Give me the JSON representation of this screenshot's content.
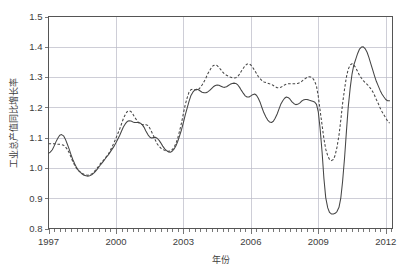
{
  "chart_data": {
    "type": "line",
    "title": "",
    "xlabel": "年份",
    "ylabel": "工业总产值同比增长率",
    "xlim": [
      1997.0,
      2012.3
    ],
    "ylim": [
      0.8,
      1.5
    ],
    "grid": true,
    "legend": "none",
    "xticks": [
      "1997",
      "2000",
      "2003",
      "2006",
      "2009",
      "2012"
    ],
    "xtick_values": [
      1997,
      2000,
      2003,
      2006,
      2009,
      2012
    ],
    "yticks": [
      "0.8",
      "0.9",
      "1.0",
      "1.1",
      "1.2",
      "1.3",
      "1.4",
      "1.5"
    ],
    "ytick_values": [
      0.8,
      0.9,
      1.0,
      1.1,
      1.2,
      1.3,
      1.4,
      1.5
    ],
    "x_minor_tick_interval": 0.25,
    "line_color": "#454545",
    "grid_color": "#b9b9c6",
    "axis_color": "#555555",
    "series": [
      {
        "name": "实际序列",
        "style": "solid",
        "x": [
          1997.0,
          1997.08,
          1997.17,
          1997.25,
          1997.33,
          1997.42,
          1997.5,
          1997.58,
          1997.67,
          1997.75,
          1997.83,
          1997.92,
          1998.0,
          1998.08,
          1998.17,
          1998.25,
          1998.33,
          1998.42,
          1998.5,
          1998.58,
          1998.67,
          1998.75,
          1998.83,
          1998.92,
          1999.0,
          1999.08,
          1999.17,
          1999.25,
          1999.33,
          1999.42,
          1999.5,
          1999.58,
          1999.67,
          1999.75,
          1999.83,
          1999.92,
          2000.0,
          2000.08,
          2000.17,
          2000.25,
          2000.33,
          2000.42,
          2000.5,
          2000.58,
          2000.67,
          2000.75,
          2000.83,
          2000.92,
          2001.0,
          2001.08,
          2001.17,
          2001.25,
          2001.33,
          2001.42,
          2001.5,
          2001.58,
          2001.67,
          2001.75,
          2001.83,
          2001.92,
          2002.0,
          2002.08,
          2002.17,
          2002.25,
          2002.33,
          2002.42,
          2002.5,
          2002.58,
          2002.67,
          2002.75,
          2002.83,
          2002.92,
          2003.0,
          2003.08,
          2003.17,
          2003.25,
          2003.33,
          2003.42,
          2003.5,
          2003.58,
          2003.67,
          2003.75,
          2003.83,
          2003.92,
          2004.0,
          2004.08,
          2004.17,
          2004.25,
          2004.33,
          2004.42,
          2004.5,
          2004.58,
          2004.67,
          2004.75,
          2004.83,
          2004.92,
          2005.0,
          2005.08,
          2005.17,
          2005.25,
          2005.33,
          2005.42,
          2005.5,
          2005.58,
          2005.67,
          2005.75,
          2005.83,
          2005.92,
          2006.0,
          2006.08,
          2006.17,
          2006.25,
          2006.33,
          2006.42,
          2006.5,
          2006.58,
          2006.67,
          2006.75,
          2006.83,
          2006.92,
          2007.0,
          2007.08,
          2007.17,
          2007.25,
          2007.33,
          2007.42,
          2007.5,
          2007.58,
          2007.67,
          2007.75,
          2007.83,
          2007.92,
          2008.0,
          2008.08,
          2008.17,
          2008.25,
          2008.33,
          2008.42,
          2008.5,
          2008.58,
          2008.67,
          2008.75,
          2008.83,
          2008.92,
          2009.0,
          2009.08,
          2009.17,
          2009.25,
          2009.33,
          2009.42,
          2009.5,
          2009.58,
          2009.67,
          2009.75,
          2009.83,
          2009.92,
          2010.0,
          2010.08,
          2010.17,
          2010.25,
          2010.33,
          2010.42,
          2010.5,
          2010.58,
          2010.67,
          2010.75,
          2010.83,
          2010.92,
          2011.0,
          2011.08,
          2011.17,
          2011.25,
          2011.33,
          2011.42,
          2011.5,
          2011.58,
          2011.67,
          2011.75,
          2011.83,
          2011.92,
          2012.0,
          2012.08,
          2012.17
        ],
        "values": [
          1.048,
          1.052,
          1.06,
          1.072,
          1.086,
          1.099,
          1.108,
          1.11,
          1.106,
          1.095,
          1.08,
          1.062,
          1.044,
          1.028,
          1.013,
          1.001,
          0.992,
          0.985,
          0.98,
          0.976,
          0.974,
          0.973,
          0.974,
          0.977,
          0.982,
          0.988,
          0.996,
          1.004,
          1.012,
          1.02,
          1.028,
          1.036,
          1.044,
          1.053,
          1.062,
          1.072,
          1.083,
          1.095,
          1.108,
          1.122,
          1.135,
          1.146,
          1.153,
          1.156,
          1.155,
          1.152,
          1.15,
          1.15,
          1.15,
          1.148,
          1.143,
          1.134,
          1.122,
          1.11,
          1.102,
          1.099,
          1.1,
          1.101,
          1.098,
          1.091,
          1.082,
          1.072,
          1.063,
          1.057,
          1.053,
          1.052,
          1.055,
          1.062,
          1.073,
          1.088,
          1.106,
          1.127,
          1.15,
          1.174,
          1.198,
          1.22,
          1.238,
          1.25,
          1.257,
          1.26,
          1.258,
          1.254,
          1.25,
          1.248,
          1.248,
          1.251,
          1.256,
          1.262,
          1.268,
          1.272,
          1.274,
          1.273,
          1.27,
          1.267,
          1.266,
          1.268,
          1.272,
          1.276,
          1.279,
          1.28,
          1.279,
          1.274,
          1.266,
          1.256,
          1.246,
          1.238,
          1.234,
          1.234,
          1.238,
          1.242,
          1.244,
          1.24,
          1.23,
          1.215,
          1.198,
          1.182,
          1.168,
          1.158,
          1.152,
          1.15,
          1.154,
          1.164,
          1.178,
          1.194,
          1.21,
          1.222,
          1.23,
          1.234,
          1.232,
          1.226,
          1.218,
          1.212,
          1.209,
          1.21,
          1.214,
          1.22,
          1.224,
          1.226,
          1.226,
          1.224,
          1.222,
          1.22,
          1.218,
          1.21,
          1.185,
          1.13,
          1.05,
          0.965,
          0.902,
          0.868,
          0.853,
          0.848,
          0.848,
          0.85,
          0.856,
          0.87,
          0.9,
          0.955,
          1.035,
          1.12,
          1.2,
          1.265,
          1.31,
          1.34,
          1.36,
          1.378,
          1.392,
          1.399,
          1.4,
          1.394,
          1.382,
          1.365,
          1.345,
          1.324,
          1.304,
          1.286,
          1.27,
          1.256,
          1.244,
          1.234,
          1.226,
          1.222,
          1.222
        ]
      },
      {
        "name": "拟合序列",
        "style": "dashed",
        "x": [
          1997.0,
          1997.08,
          1997.17,
          1997.25,
          1997.33,
          1997.42,
          1997.5,
          1997.58,
          1997.67,
          1997.75,
          1997.83,
          1997.92,
          1998.0,
          1998.08,
          1998.17,
          1998.25,
          1998.33,
          1998.42,
          1998.5,
          1998.58,
          1998.67,
          1998.75,
          1998.83,
          1998.92,
          1999.0,
          1999.08,
          1999.17,
          1999.25,
          1999.33,
          1999.42,
          1999.5,
          1999.58,
          1999.67,
          1999.75,
          1999.83,
          1999.92,
          2000.0,
          2000.08,
          2000.17,
          2000.25,
          2000.33,
          2000.42,
          2000.5,
          2000.58,
          2000.67,
          2000.75,
          2000.83,
          2000.92,
          2001.0,
          2001.08,
          2001.17,
          2001.25,
          2001.33,
          2001.42,
          2001.5,
          2001.58,
          2001.67,
          2001.75,
          2001.83,
          2001.92,
          2002.0,
          2002.08,
          2002.17,
          2002.25,
          2002.33,
          2002.42,
          2002.5,
          2002.58,
          2002.67,
          2002.75,
          2002.83,
          2002.92,
          2003.0,
          2003.08,
          2003.17,
          2003.25,
          2003.33,
          2003.42,
          2003.5,
          2003.58,
          2003.67,
          2003.75,
          2003.83,
          2003.92,
          2004.0,
          2004.08,
          2004.17,
          2004.25,
          2004.33,
          2004.42,
          2004.5,
          2004.58,
          2004.67,
          2004.75,
          2004.83,
          2004.92,
          2005.0,
          2005.08,
          2005.17,
          2005.25,
          2005.33,
          2005.42,
          2005.5,
          2005.58,
          2005.67,
          2005.75,
          2005.83,
          2005.92,
          2006.0,
          2006.08,
          2006.17,
          2006.25,
          2006.33,
          2006.42,
          2006.5,
          2006.58,
          2006.67,
          2006.75,
          2006.83,
          2006.92,
          2007.0,
          2007.08,
          2007.17,
          2007.25,
          2007.33,
          2007.42,
          2007.5,
          2007.58,
          2007.67,
          2007.75,
          2007.83,
          2007.92,
          2008.0,
          2008.08,
          2008.17,
          2008.25,
          2008.33,
          2008.42,
          2008.5,
          2008.58,
          2008.67,
          2008.75,
          2008.83,
          2008.92,
          2009.0,
          2009.08,
          2009.17,
          2009.25,
          2009.33,
          2009.42,
          2009.5,
          2009.58,
          2009.67,
          2009.75,
          2009.83,
          2009.92,
          2010.0,
          2010.08,
          2010.17,
          2010.25,
          2010.33,
          2010.42,
          2010.5,
          2010.58,
          2010.67,
          2010.75,
          2010.83,
          2010.92,
          2011.0,
          2011.08,
          2011.17,
          2011.25,
          2011.33,
          2011.42,
          2011.5,
          2011.58,
          2011.67,
          2011.75,
          2011.83,
          2011.92,
          2012.0,
          2012.08,
          2012.17
        ],
        "values": [
          1.08,
          1.08,
          1.08,
          1.08,
          1.079,
          1.078,
          1.078,
          1.077,
          1.075,
          1.07,
          1.062,
          1.05,
          1.036,
          1.021,
          1.008,
          0.998,
          0.991,
          0.986,
          0.982,
          0.979,
          0.977,
          0.976,
          0.977,
          0.98,
          0.985,
          0.992,
          1.0,
          1.008,
          1.016,
          1.023,
          1.03,
          1.038,
          1.047,
          1.058,
          1.07,
          1.084,
          1.098,
          1.113,
          1.129,
          1.146,
          1.163,
          1.177,
          1.186,
          1.189,
          1.186,
          1.178,
          1.168,
          1.158,
          1.15,
          1.145,
          1.143,
          1.143,
          1.143,
          1.14,
          1.132,
          1.12,
          1.106,
          1.092,
          1.08,
          1.071,
          1.065,
          1.061,
          1.058,
          1.056,
          1.055,
          1.056,
          1.06,
          1.068,
          1.081,
          1.099,
          1.122,
          1.15,
          1.18,
          1.208,
          1.232,
          1.25,
          1.258,
          1.26,
          1.258,
          1.257,
          1.259,
          1.265,
          1.274,
          1.285,
          1.297,
          1.31,
          1.322,
          1.332,
          1.338,
          1.34,
          1.338,
          1.332,
          1.324,
          1.316,
          1.31,
          1.306,
          1.303,
          1.3,
          1.298,
          1.297,
          1.298,
          1.302,
          1.31,
          1.32,
          1.33,
          1.338,
          1.343,
          1.344,
          1.34,
          1.332,
          1.322,
          1.312,
          1.302,
          1.294,
          1.288,
          1.284,
          1.282,
          1.28,
          1.278,
          1.276,
          1.272,
          1.268,
          1.265,
          1.264,
          1.266,
          1.27,
          1.274,
          1.277,
          1.278,
          1.278,
          1.278,
          1.278,
          1.278,
          1.279,
          1.281,
          1.285,
          1.29,
          1.295,
          1.299,
          1.301,
          1.3,
          1.296,
          1.288,
          1.27,
          1.236,
          1.19,
          1.14,
          1.096,
          1.062,
          1.04,
          1.028,
          1.024,
          1.028,
          1.042,
          1.068,
          1.108,
          1.158,
          1.212,
          1.262,
          1.3,
          1.326,
          1.34,
          1.344,
          1.34,
          1.33,
          1.318,
          1.306,
          1.296,
          1.288,
          1.282,
          1.276,
          1.27,
          1.262,
          1.252,
          1.24,
          1.226,
          1.212,
          1.198,
          1.186,
          1.175,
          1.165,
          1.155,
          1.148
        ]
      }
    ]
  },
  "axes": {
    "ylabel": "工业总产值同比增长率",
    "xlabel": "年份"
  }
}
